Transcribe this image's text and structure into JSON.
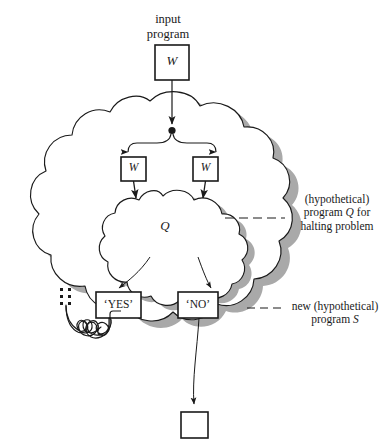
{
  "figure": {
    "domain": "diagram",
    "background": "#ffffff",
    "ink_color": "#1a1a1a",
    "shadow_color": "#a9a9a9"
  },
  "labels": {
    "input_program_line1": "input",
    "input_program_line2": "program",
    "annotation_q_line1": "(hypothetical)",
    "annotation_q_line2_pre": "program ",
    "annotation_q_line2_italic": "Q",
    "annotation_q_line2_post": " for",
    "annotation_q_line3": "halting problem",
    "annotation_s_line1": "new (hypothetical)",
    "annotation_s_line2_pre": "program ",
    "annotation_s_line2_italic": "S"
  },
  "nodes": {
    "input_box": {
      "label": "W",
      "italic": true
    },
    "branch_left_box": {
      "label": "W",
      "italic": true
    },
    "branch_right_box": {
      "label": "W",
      "italic": true
    },
    "inner_cloud": {
      "label": "Q",
      "italic": true
    },
    "yes_box": {
      "label": "‘YES’"
    },
    "no_box": {
      "label": "‘NO’"
    },
    "output_box": {
      "label": ""
    }
  },
  "structure": {
    "outer_cloud_name": "new (hypothetical) program S",
    "inner_cloud_name": "(hypothetical) program Q for halting problem",
    "loop_name": "infinite-loop-spiral",
    "dots_name": "ellipsis-dots",
    "junction_name": "branch-junction-dot"
  },
  "colors": {
    "outline": "#1a1a1a",
    "shadow": "#a9a9a9",
    "white": "#ffffff"
  }
}
